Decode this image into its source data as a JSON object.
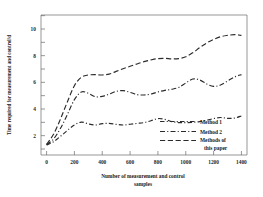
{
  "figure": {
    "background_color": "#ffffff",
    "line_color": "#2b2b2b",
    "axis_color": "#6b6b6b"
  },
  "axes": {
    "x_title_line1": "Number of measurement and control",
    "x_title_line2": "samples",
    "y_title": "Time required for measurement and control/d",
    "x_ticks": [
      "0",
      "200",
      "400",
      "600",
      "800",
      "1000",
      "1200",
      "1400"
    ],
    "y_ticks": [
      "2",
      "4",
      "6",
      "8",
      "10"
    ]
  },
  "legend": {
    "items": [
      {
        "label": "Method 1",
        "dash": "dashdot-1"
      },
      {
        "label": "Method 2",
        "dash": "dashdot-2"
      },
      {
        "label_line1": "Methods of",
        "label_line2": "this paper",
        "dash": "dashed"
      }
    ],
    "label_0": "Method 1",
    "label_1": "Method 2",
    "label_2a": "Methods of",
    "label_2b": "this paper"
  },
  "chart_data": {
    "type": "line",
    "title": "",
    "xlabel": "Number of measurement and control samples",
    "ylabel": "Time required for measurement and control/d",
    "xlim": [
      -40,
      1440
    ],
    "ylim": [
      0.55,
      11.05
    ],
    "xticks": [
      0,
      200,
      400,
      600,
      800,
      1000,
      1200,
      1400
    ],
    "yticks": [
      2,
      4,
      6,
      8,
      10
    ],
    "grid": false,
    "legend_position": "lower-right-inside",
    "x": [
      0,
      50,
      100,
      150,
      200,
      250,
      300,
      350,
      400,
      450,
      500,
      550,
      600,
      650,
      700,
      750,
      800,
      850,
      900,
      950,
      1000,
      1050,
      1100,
      1150,
      1200,
      1250,
      1300,
      1350,
      1400
    ],
    "series": [
      {
        "name": "Method 1",
        "linestyle": "dashdot",
        "values": [
          1.3,
          1.55,
          1.95,
          2.4,
          2.8,
          3.02,
          2.88,
          2.8,
          2.9,
          2.92,
          2.85,
          2.8,
          2.86,
          2.92,
          2.98,
          3.12,
          3.28,
          3.22,
          3.05,
          2.98,
          2.98,
          3.0,
          3.05,
          3.15,
          3.28,
          3.36,
          3.3,
          3.32,
          3.48
        ]
      },
      {
        "name": "Method 2",
        "linestyle": "dashdot",
        "values": [
          1.32,
          1.75,
          2.55,
          3.6,
          4.7,
          5.28,
          5.18,
          4.92,
          4.95,
          5.12,
          5.32,
          5.38,
          5.25,
          5.08,
          5.05,
          5.12,
          5.28,
          5.4,
          5.48,
          5.62,
          5.95,
          6.25,
          6.18,
          5.88,
          5.7,
          5.8,
          6.1,
          6.4,
          6.58
        ]
      },
      {
        "name": "Methods of this paper",
        "linestyle": "dashed",
        "values": [
          1.35,
          2.1,
          3.25,
          4.55,
          5.75,
          6.38,
          6.55,
          6.58,
          6.55,
          6.62,
          6.82,
          7.02,
          7.2,
          7.38,
          7.55,
          7.68,
          7.78,
          7.8,
          7.76,
          7.78,
          7.92,
          8.22,
          8.6,
          8.95,
          9.22,
          9.42,
          9.52,
          9.58,
          9.52
        ]
      }
    ]
  }
}
